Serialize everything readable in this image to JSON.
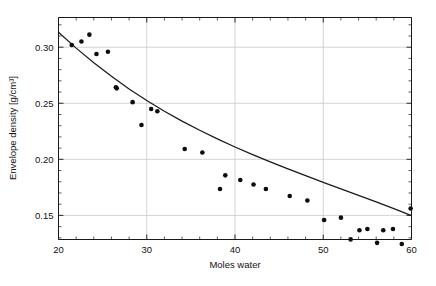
{
  "figure": {
    "background_color": "#ffffff",
    "axis_color": "#1a1a1a",
    "grid_color": "#c8c8c8",
    "point_color": "#0d0d0d",
    "curve_color": "#1a1a1a"
  },
  "chart_data": {
    "type": "scatter",
    "title": "",
    "xlabel": "Moles water",
    "ylabel": "Envelope density [g/cm³]",
    "xlim": [
      20,
      60
    ],
    "ylim": [
      0.1285,
      0.3265
    ],
    "xticks": [
      20,
      30,
      40,
      50,
      60
    ],
    "xtick_labels": [
      "20",
      "30",
      "40",
      "50",
      "60"
    ],
    "yticks": [
      0.15,
      0.2,
      0.25,
      0.3
    ],
    "ytick_labels": [
      "0.15",
      "0.20",
      "0.25",
      "0.30"
    ],
    "minor_tick_spacing_x": 2,
    "minor_tick_spacing_y": 0.01,
    "grid": true,
    "grid_axes": "both",
    "legend": null,
    "legend_position": "none",
    "series": [
      {
        "name": "measured envelope density",
        "type": "scatter",
        "marker": "circle",
        "marker_size": 4.6,
        "color": "#0d0d0d",
        "points": [
          [
            21.5,
            0.302
          ],
          [
            22.6,
            0.3051
          ],
          [
            23.5,
            0.3112
          ],
          [
            24.3,
            0.2939
          ],
          [
            25.6,
            0.2959
          ],
          [
            26.5,
            0.2643
          ],
          [
            26.6,
            0.2633
          ],
          [
            28.4,
            0.251
          ],
          [
            29.4,
            0.2306
          ],
          [
            30.5,
            0.2449
          ],
          [
            31.2,
            0.2429
          ],
          [
            34.3,
            0.2092
          ],
          [
            36.3,
            0.2061
          ],
          [
            38.3,
            0.1735
          ],
          [
            38.9,
            0.1857
          ],
          [
            40.6,
            0.1816
          ],
          [
            42.1,
            0.1776
          ],
          [
            43.5,
            0.1735
          ],
          [
            46.2,
            0.1673
          ],
          [
            48.2,
            0.1633
          ],
          [
            50.1,
            0.1459
          ],
          [
            52.0,
            0.148
          ],
          [
            53.1,
            0.1286
          ],
          [
            54.1,
            0.1367
          ],
          [
            55.0,
            0.1378
          ],
          [
            56.1,
            0.1255
          ],
          [
            56.8,
            0.1367
          ],
          [
            57.9,
            0.1378
          ],
          [
            58.9,
            0.1245
          ],
          [
            59.9,
            0.1561
          ]
        ]
      },
      {
        "name": "fitted decay curve",
        "type": "line",
        "color": "#1a1a1a",
        "line_width": 1.25,
        "points": [
          [
            20.0,
            0.3133
          ],
          [
            22.0,
            0.2992
          ],
          [
            24.0,
            0.2861
          ],
          [
            26.0,
            0.274
          ],
          [
            28.0,
            0.2628
          ],
          [
            30.0,
            0.2525
          ],
          [
            32.0,
            0.2429
          ],
          [
            34.0,
            0.2341
          ],
          [
            36.0,
            0.2259
          ],
          [
            38.0,
            0.2182
          ],
          [
            40.0,
            0.211
          ],
          [
            42.0,
            0.2042
          ],
          [
            44.0,
            0.1977
          ],
          [
            46.0,
            0.1915
          ],
          [
            48.0,
            0.1854
          ],
          [
            50.0,
            0.1795
          ],
          [
            52.0,
            0.1737
          ],
          [
            54.0,
            0.1679
          ],
          [
            56.0,
            0.162
          ],
          [
            58.0,
            0.156
          ],
          [
            60.0,
            0.1498
          ]
        ]
      }
    ]
  }
}
